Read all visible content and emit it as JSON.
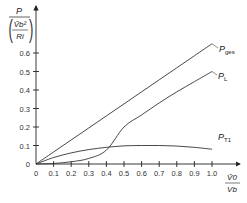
{
  "chart_data": {
    "type": "line",
    "title": "",
    "xlabel": {
      "numerator": "V̂0",
      "denominator": "Vb"
    },
    "ylabel": {
      "numerator": "P",
      "denominator_num": "V̂b²",
      "denominator_den": "Ri"
    },
    "xlim": [
      0,
      1.0
    ],
    "ylim": [
      0,
      0.6
    ],
    "x_ticks": [
      0,
      0.1,
      0.2,
      0.3,
      0.4,
      0.5,
      0.6,
      0.7,
      0.8,
      0.9,
      1.0
    ],
    "x_tick_labels": [
      "0",
      "0.1",
      "0.2",
      "0.3",
      "0.4",
      "0.5",
      "0.6",
      "0.7",
      "0.8",
      "0.9",
      "1.0"
    ],
    "y_ticks": [
      0,
      0.1,
      0.2,
      0.3,
      0.4,
      0.5,
      0.6
    ],
    "y_tick_labels": [
      "0",
      "0.1",
      "0.2",
      "0.3",
      "0.4",
      "0.5",
      "0.6"
    ],
    "grid": false,
    "x": [
      0,
      0.1,
      0.2,
      0.3,
      0.4,
      0.5,
      0.6,
      0.7,
      0.8,
      0.9,
      1.0
    ],
    "series": [
      {
        "name": "P_ges",
        "label_main": "P",
        "label_sub": "ges",
        "values": [
          0,
          0.065,
          0.13,
          0.195,
          0.26,
          0.325,
          0.39,
          0.455,
          0.52,
          0.585,
          0.65
        ]
      },
      {
        "name": "P_L",
        "label_main": "P",
        "label_sub": "L",
        "values": [
          0,
          0.003,
          0.012,
          0.03,
          0.075,
          0.2,
          0.265,
          0.33,
          0.39,
          0.445,
          0.5
        ]
      },
      {
        "name": "P_T1",
        "label_main": "P",
        "label_sub": "T1",
        "values": [
          0,
          0.035,
          0.06,
          0.078,
          0.09,
          0.098,
          0.1,
          0.1,
          0.097,
          0.09,
          0.08
        ]
      }
    ]
  }
}
